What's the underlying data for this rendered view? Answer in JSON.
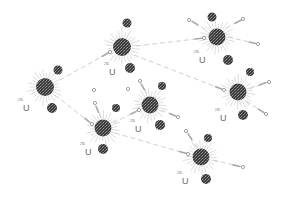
{
  "diagram": {
    "colors": {
      "nucleus": "#3a3a3a",
      "nucleus_speckle": "#8a8a8a",
      "fragment": "#404040",
      "spike": "#c4c4c4",
      "path": "#cfcfcf",
      "neutron": "#7a7a7a",
      "label": "#6a6a6a"
    },
    "nuclei": [
      {
        "id": "n1",
        "x": 45,
        "y": 87,
        "r": 9,
        "label": {
          "mass": "235",
          "symbol": "U",
          "x": 18,
          "y": 98
        }
      },
      {
        "id": "n2",
        "x": 122,
        "y": 47,
        "r": 9,
        "label": {
          "mass": "235",
          "symbol": "U",
          "x": 104,
          "y": 62
        }
      },
      {
        "id": "n3",
        "x": 217,
        "y": 37,
        "r": 8.5,
        "label": {
          "mass": "235",
          "symbol": "U",
          "x": 194,
          "y": 50
        }
      },
      {
        "id": "n4",
        "x": 238,
        "y": 92,
        "r": 8.5,
        "label": {
          "mass": "235",
          "symbol": "U",
          "x": 215,
          "y": 108
        }
      },
      {
        "id": "n5",
        "x": 150,
        "y": 105,
        "r": 8.5,
        "label": {
          "mass": "235",
          "symbol": "U",
          "x": 130,
          "y": 119
        }
      },
      {
        "id": "n6",
        "x": 103,
        "y": 128,
        "r": 8.5,
        "label": {
          "mass": "235",
          "symbol": "U",
          "x": 80,
          "y": 142
        }
      },
      {
        "id": "n7",
        "x": 201,
        "y": 157,
        "r": 8.5,
        "label": {
          "mass": "235",
          "symbol": "U",
          "x": 177,
          "y": 171
        }
      }
    ],
    "fragments": [
      {
        "x": 58,
        "y": 70,
        "r": 4.5
      },
      {
        "x": 52,
        "y": 108,
        "r": 5
      },
      {
        "x": 127,
        "y": 23,
        "r": 4.5
      },
      {
        "x": 130,
        "y": 68,
        "r": 5
      },
      {
        "x": 212,
        "y": 17,
        "r": 4.5
      },
      {
        "x": 228,
        "y": 60,
        "r": 5
      },
      {
        "x": 250,
        "y": 72,
        "r": 4
      },
      {
        "x": 243,
        "y": 115,
        "r": 5
      },
      {
        "x": 162,
        "y": 86,
        "r": 4
      },
      {
        "x": 160,
        "y": 125,
        "r": 5
      },
      {
        "x": 116,
        "y": 108,
        "r": 4
      },
      {
        "x": 103,
        "y": 149,
        "r": 5
      },
      {
        "x": 208,
        "y": 138,
        "r": 4
      },
      {
        "x": 206,
        "y": 179,
        "r": 5
      }
    ],
    "neutron_paths": [
      {
        "from": [
          60,
          80
        ],
        "to": [
          110,
          52
        ]
      },
      {
        "from": [
          55,
          95
        ],
        "to": [
          92,
          124
        ]
      },
      {
        "from": [
          136,
          46
        ],
        "to": [
          204,
          38
        ]
      },
      {
        "from": [
          134,
          55
        ],
        "to": [
          224,
          90
        ]
      },
      {
        "from": [
          113,
          123
        ],
        "to": [
          139,
          110
        ]
      },
      {
        "from": [
          115,
          133
        ],
        "to": [
          188,
          154
        ]
      },
      {
        "from": [
          228,
          37
        ],
        "to": [
          258,
          44
        ]
      },
      {
        "from": [
          206,
          30
        ],
        "to": [
          190,
          20
        ]
      },
      {
        "from": [
          226,
          28
        ],
        "to": [
          243,
          19
        ]
      },
      {
        "from": [
          249,
          89
        ],
        "to": [
          268,
          82
        ]
      },
      {
        "from": [
          246,
          101
        ],
        "to": [
          266,
          114
        ]
      },
      {
        "from": [
          161,
          110
        ],
        "to": [
          178,
          117
        ]
      },
      {
        "from": [
          147,
          94
        ],
        "to": [
          140,
          82
        ]
      },
      {
        "from": [
          213,
          160
        ],
        "to": [
          242,
          167
        ]
      },
      {
        "from": [
          197,
          148
        ],
        "to": [
          187,
          132
        ]
      },
      {
        "from": [
          101,
          118
        ],
        "to": [
          95,
          104
        ]
      }
    ],
    "neutrons": [
      {
        "x": 110,
        "y": 52
      },
      {
        "x": 92,
        "y": 124
      },
      {
        "x": 204,
        "y": 38
      },
      {
        "x": 224,
        "y": 90
      },
      {
        "x": 139,
        "y": 110
      },
      {
        "x": 188,
        "y": 154
      },
      {
        "x": 258,
        "y": 44
      },
      {
        "x": 189,
        "y": 20
      },
      {
        "x": 243,
        "y": 19
      },
      {
        "x": 269,
        "y": 82
      },
      {
        "x": 266,
        "y": 114
      },
      {
        "x": 178,
        "y": 117
      },
      {
        "x": 140,
        "y": 81
      },
      {
        "x": 243,
        "y": 167
      },
      {
        "x": 186,
        "y": 131
      },
      {
        "x": 95,
        "y": 103
      },
      {
        "x": 94,
        "y": 90
      },
      {
        "x": 128,
        "y": 89
      }
    ]
  }
}
